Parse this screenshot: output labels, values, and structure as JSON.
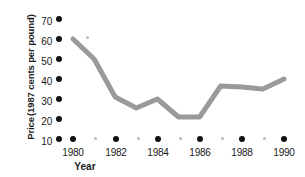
{
  "chart_data": {
    "type": "line",
    "title": "",
    "xlabel": "Year",
    "ylabel": "Price (1987 cents per pound)",
    "ylabel_lines": [
      "Price",
      "(1987 cents per pound)"
    ],
    "x": [
      1980,
      1981,
      1982,
      1983,
      1984,
      1985,
      1986,
      1987,
      1988,
      1989,
      1990
    ],
    "values": [
      60,
      50,
      31,
      25.5,
      30,
      21,
      21,
      36.5,
      36,
      35,
      40
    ],
    "series": [
      {
        "name": "Price",
        "values": [
          60,
          50,
          31,
          25.5,
          30,
          21,
          21,
          36.5,
          36,
          35,
          40
        ],
        "color": "#9a9a9a"
      }
    ],
    "xlim": [
      1979.3,
      1990.6
    ],
    "ylim": [
      10,
      72
    ],
    "yticks": [
      70,
      60,
      50,
      40,
      30,
      20,
      10
    ],
    "ytick_labels": [
      "70",
      "60",
      "50",
      "40",
      "30",
      "20",
      "10"
    ],
    "xticks": [
      1980,
      1982,
      1984,
      1986,
      1988,
      1990
    ],
    "xtick_labels": [
      "1980",
      "1982",
      "1984",
      "1986",
      "1988",
      "1990"
    ],
    "xticks_minor": [
      1981,
      1983,
      1985,
      1987,
      1989
    ],
    "grid": false,
    "legend": "none",
    "axis_style": "dotted-bullet-axis",
    "colors": {
      "line": "#9a9a9a",
      "axis_dot_major": "#111111",
      "axis_dot_minor": "#b9b9b9",
      "text": "#1a1a1a",
      "background": "#ffffff"
    }
  }
}
